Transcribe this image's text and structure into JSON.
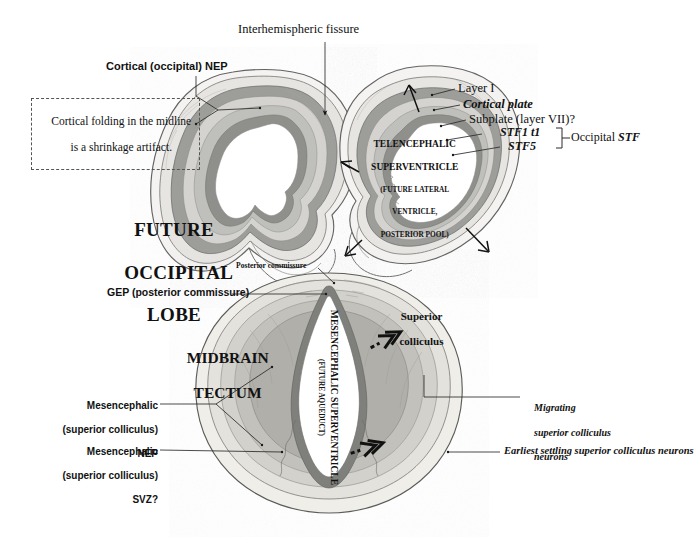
{
  "figure": {
    "background": "#ffffff",
    "ink": "#111111"
  },
  "palette": {
    "outline": "#4a4a4a",
    "layer_marginal": "#f2f2f0",
    "layer_cortical_plate": "#b9b9b6",
    "layer_subplate": "#d8d8d4",
    "layer_stf": "#c7c7c3",
    "layer_nep": "#8e8e8b",
    "parenchyma": "#eceae5",
    "ventricle": "#ffffff",
    "leader": "#333333"
  },
  "upper_panel": {
    "name": "occipital-lobe-panel",
    "labels": {
      "interhemispheric_fissure": "Interhemispheric fissure",
      "cortical_nep": "Cortical (occipital) NEP",
      "shrinkage_note_line1": "Cortical folding in the midline",
      "shrinkage_note_line2": "is a shrinkage artifact.",
      "future_occipital_lobe_line1": "FUTURE",
      "future_occipital_lobe_line2": "OCCIPITAL",
      "future_occipital_lobe_line3": "LOBE",
      "layer_i": "Layer I",
      "cortical_plate": "Cortical plate",
      "subplate": "Subplate (layer VII)?",
      "stf1_t1": "STF1 t1",
      "stf5": "STF5",
      "occipital_stf_prefix": "Occipital ",
      "occipital_stf_italic": "STF",
      "telencephalic_line1": "TELENCEPHALIC",
      "telencephalic_line2": "SUPERVENTRICLE",
      "telencephalic_sub1": "(FUTURE LATERAL",
      "telencephalic_sub2": "VENTRICLE,",
      "telencephalic_sub3": "POSTERIOR POOL)"
    }
  },
  "lower_panel": {
    "name": "midbrain-tectum-panel",
    "labels": {
      "posterior_commissure": "Posterior commissure",
      "gep_posterior_commissure": "GEP (posterior commissure)",
      "midbrain_line1": "MIDBRAIN",
      "midbrain_line2": "TECTUM",
      "superior_colliculus_line1": "Superior",
      "superior_colliculus_line2": "colliculus",
      "mes_nep_line1": "Mesencephalic",
      "mes_nep_line2": "(superior colliculus)",
      "mes_nep_line3": "NEP",
      "mes_svz_line1": "Mesencephalic",
      "mes_svz_line2": "(superior colliculus)",
      "mes_svz_line3": "SVZ?",
      "migrating_line1": "Migrating",
      "migrating_line2": "superior colliculus",
      "migrating_line3": "neurons",
      "earliest_settling": "Earliest settling superior colliculus neurons",
      "mesencephalic_superventricle_line1": "MESENCEPHALIC SUPERVENTRICLE",
      "mesencephalic_superventricle_sub": "(FUTURE AQUEDUCT)"
    }
  }
}
